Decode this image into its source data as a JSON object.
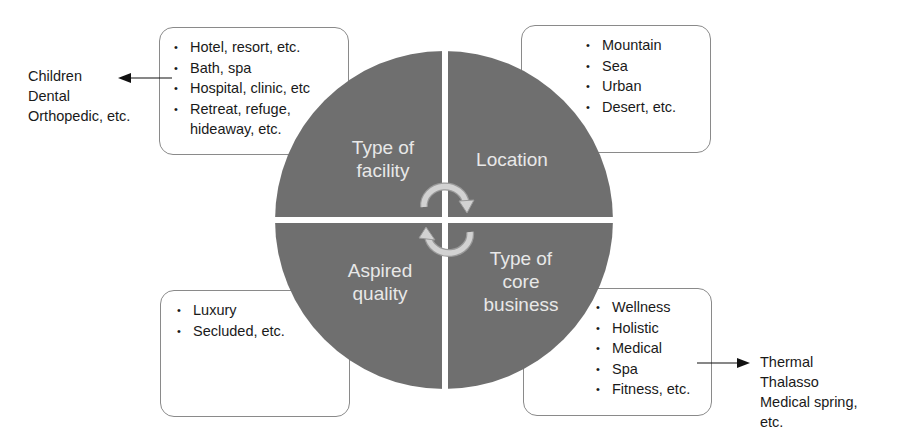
{
  "diagram": {
    "type": "quadrant-circle",
    "colors": {
      "quadrant_fill": "#6f6f6f",
      "quadrant_text": "#e8e8e8",
      "box_border": "#8a8a8a",
      "arrow_fill": "#cfcfcf",
      "text": "#1a1a1a"
    },
    "quadrants": {
      "top_left": {
        "label_lines": [
          "Type of",
          "facility"
        ]
      },
      "top_right": {
        "label_lines": [
          "Location"
        ]
      },
      "bottom_left": {
        "label_lines": [
          "Aspired",
          "quality"
        ]
      },
      "bottom_right": {
        "label_lines": [
          "Type of",
          "core",
          "business"
        ]
      }
    },
    "boxes": {
      "facility": {
        "items": [
          "Hotel, resort, etc.",
          "Bath, spa",
          "Hospital, clinic, etc",
          "Retreat, refuge,"
        ],
        "item_continuation": "hideaway, etc."
      },
      "location": {
        "items": [
          "Mountain",
          "Sea",
          "Urban",
          "Desert, etc."
        ]
      },
      "quality": {
        "items": [
          "Luxury",
          "Secluded, etc."
        ]
      },
      "core_business": {
        "items": [
          "Wellness",
          "Holistic",
          "Medical",
          "Spa",
          "Fitness, etc."
        ]
      }
    },
    "callouts": {
      "facility_specialties": {
        "lines": [
          "Children",
          "Dental",
          "Orthopedic, etc."
        ]
      },
      "spa_types": {
        "lines": [
          "Thermal",
          "Thalasso",
          "Medical spring,",
          "etc."
        ]
      }
    },
    "bullet_glyph": "•"
  }
}
